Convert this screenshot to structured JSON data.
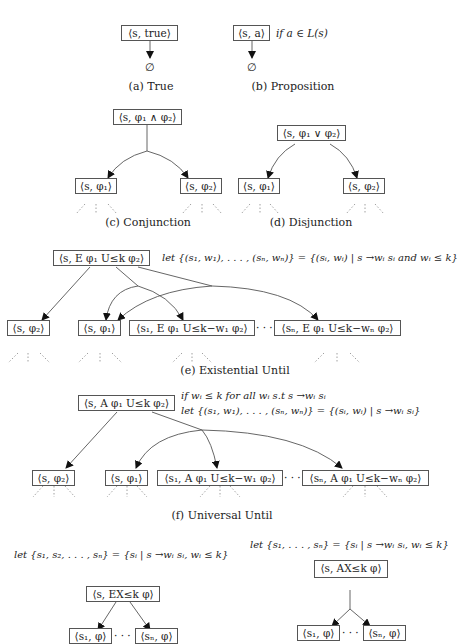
{
  "figure": {
    "a": {
      "node": "⟨s, true⟩",
      "result": "∅",
      "caption": "(a) True"
    },
    "b": {
      "node": "⟨s, a⟩",
      "condition": "if a ∈ L(s)",
      "result": "∅",
      "caption": "(b) Proposition"
    },
    "c": {
      "root": "⟨s, φ₁ ∧ φ₂⟩",
      "children": [
        "⟨s, φ₁⟩",
        "⟨s, φ₂⟩"
      ],
      "caption": "(c) Conjunction"
    },
    "d": {
      "root": "⟨s, φ₁ ∨ φ₂⟩",
      "children": [
        "⟨s, φ₁⟩",
        "⟨s, φ₂⟩"
      ],
      "caption": "(d) Disjunction"
    },
    "e": {
      "root": "⟨s, E φ₁ U≤k φ₂⟩",
      "condition": "let {(s₁, w₁), . . . , (sₙ, wₙ)} = {(sᵢ, wᵢ) | s →wᵢ sᵢ and wᵢ ≤ k}",
      "children": [
        "⟨s, φ₂⟩",
        "⟨s, φ₁⟩",
        "⟨s₁, E φ₁ U≤k−w₁ φ₂⟩",
        "⟨sₙ, E φ₁ U≤k−wₙ φ₂⟩"
      ],
      "ellipsis": "· · ·",
      "caption": "(e) Existential Until"
    },
    "f": {
      "root": "⟨s, A φ₁ U≤k φ₂⟩",
      "condition_1": "if wᵢ ≤ k for all wᵢ s.t s →wᵢ sᵢ",
      "condition_2": "let {(s₁, w₁), . . . , (sₙ, wₙ)} = {(sᵢ, wᵢ) | s →wᵢ sᵢ}",
      "children": [
        "⟨s, φ₂⟩",
        "⟨s, φ₁⟩",
        "⟨s₁, A φ₁ U≤k−w₁ φ₂⟩",
        "⟨sₙ, A φ₁ U≤k−wₙ φ₂⟩"
      ],
      "ellipsis": "· · ·",
      "caption": "(f) Universal Until"
    },
    "g": {
      "condition": "let {s₁, s₂, . . . , sₙ} = {sᵢ | s →wᵢ sᵢ, wᵢ ≤ k}",
      "root": "⟨s, EX≤k φ⟩",
      "children": [
        "⟨s₁, φ⟩",
        "⟨sₙ, φ⟩"
      ],
      "ellipsis": "· · ·"
    },
    "h": {
      "condition": "let {s₁, . . . , sₙ} = {sᵢ | s →wᵢ sᵢ, wᵢ ≤ k}",
      "root": "⟨s, AX≤k φ⟩",
      "children": [
        "⟨s₁, φ⟩",
        "⟨sₙ, φ⟩"
      ],
      "ellipsis": "· · ·"
    }
  }
}
